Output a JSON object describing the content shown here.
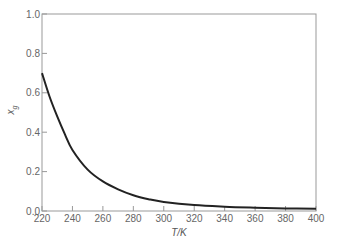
{
  "chart_data": {
    "type": "line",
    "title": "",
    "xlabel": "T/K",
    "ylabel": "x_g",
    "ylabel_main": "x",
    "ylabel_sub": "g",
    "xlim": [
      220,
      400
    ],
    "ylim": [
      0.0,
      1.0
    ],
    "grid": false,
    "legend": null,
    "xticks": [
      220,
      240,
      260,
      280,
      300,
      320,
      340,
      360,
      380,
      400
    ],
    "yticks": [
      0.0,
      0.2,
      0.4,
      0.6,
      0.8,
      1.0
    ],
    "ytick_labels": [
      "0.0",
      "0.2",
      "0.4",
      "0.6",
      "0.8",
      "1.0"
    ],
    "series": [
      {
        "name": "x_g",
        "color": "#222222",
        "x": [
          220,
          225,
          230,
          235,
          240,
          250,
          260,
          270,
          280,
          290,
          300,
          320,
          340,
          360,
          380,
          400
        ],
        "y": [
          0.7,
          0.58,
          0.48,
          0.39,
          0.31,
          0.21,
          0.15,
          0.11,
          0.08,
          0.06,
          0.046,
          0.03,
          0.022,
          0.017,
          0.013,
          0.011
        ]
      }
    ]
  },
  "colors": {
    "axis": "#999999",
    "curve": "#222222",
    "text": "#666666"
  }
}
